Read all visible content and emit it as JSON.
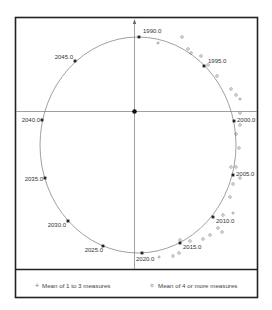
{
  "chart_data": {
    "type": "scatter",
    "title": "",
    "xlabel": "",
    "ylabel": "",
    "grid": false,
    "legend_position": "bottom",
    "reference_ellipse": {
      "center_px": [
        138,
        145
      ],
      "rx_px": 98,
      "ry_px": 108
    },
    "origin_px": [
      134,
      111
    ],
    "year_markers": [
      {
        "label": "1990.0",
        "x": 139,
        "y": 37,
        "lx": 143,
        "ly": 33,
        "anchor": "start"
      },
      {
        "label": "1995.0",
        "x": 204,
        "y": 66,
        "lx": 208,
        "ly": 63,
        "anchor": "start"
      },
      {
        "label": "2000.0",
        "x": 234,
        "y": 121,
        "lx": 237,
        "ly": 122,
        "anchor": "start"
      },
      {
        "label": "2005.0",
        "x": 233,
        "y": 175,
        "lx": 236,
        "ly": 176,
        "anchor": "start"
      },
      {
        "label": "2010.0",
        "x": 213,
        "y": 217,
        "lx": 216,
        "ly": 223,
        "anchor": "start"
      },
      {
        "label": "2015.0",
        "x": 180,
        "y": 243,
        "lx": 183,
        "ly": 249,
        "anchor": "start"
      },
      {
        "label": "2020.0",
        "x": 142,
        "y": 253,
        "lx": 136,
        "ly": 261,
        "anchor": "start"
      },
      {
        "label": "2025.0",
        "x": 103,
        "y": 246,
        "lx": 103,
        "ly": 252,
        "anchor": "end"
      },
      {
        "label": "2030.0",
        "x": 68,
        "y": 221,
        "lx": 66,
        "ly": 227,
        "anchor": "end"
      },
      {
        "label": "2035.0",
        "x": 45,
        "y": 178,
        "lx": 43,
        "ly": 181,
        "anchor": "end"
      },
      {
        "label": "2040.0",
        "x": 42,
        "y": 120,
        "lx": 40,
        "ly": 122,
        "anchor": "end"
      },
      {
        "label": "2045.0",
        "x": 75,
        "y": 61,
        "lx": 73,
        "ly": 59,
        "anchor": "end"
      }
    ],
    "series": [
      {
        "name": "Mean of 1 to 3 measures",
        "marker": "plus",
        "points": [
          [
            158,
            43
          ],
          [
            240,
            99
          ],
          [
            233,
            213
          ],
          [
            159,
            257
          ]
        ]
      },
      {
        "name": "Mean of 4 or more measures",
        "marker": "circle",
        "points": [
          [
            182,
            37
          ],
          [
            188,
            49
          ],
          [
            191,
            53
          ],
          [
            201,
            56
          ],
          [
            208,
            65
          ],
          [
            217,
            76
          ],
          [
            231,
            89
          ],
          [
            236,
            95
          ],
          [
            240,
            113
          ],
          [
            240,
            125
          ],
          [
            236,
            134
          ],
          [
            239,
            148
          ],
          [
            236,
            167
          ],
          [
            231,
            167
          ],
          [
            240,
            178
          ],
          [
            233,
            184
          ],
          [
            230,
            197
          ],
          [
            223,
            215
          ],
          [
            218,
            228
          ],
          [
            222,
            232
          ],
          [
            210,
            235
          ],
          [
            203,
            239
          ],
          [
            190,
            241
          ],
          [
            180,
            240
          ],
          [
            179,
            253
          ],
          [
            173,
            256
          ]
        ]
      }
    ]
  },
  "legend": {
    "items": [
      {
        "symbol": "+",
        "label": "Mean of 1 to 3 measures"
      },
      {
        "symbol": "o",
        "label": "Mean of 4 or more measures"
      }
    ]
  },
  "colors": {
    "frame": "#222222",
    "axis": "#888888",
    "ellipse": "#888888",
    "marker": "#222222",
    "open_marker": "#777777",
    "text": "#333333"
  }
}
